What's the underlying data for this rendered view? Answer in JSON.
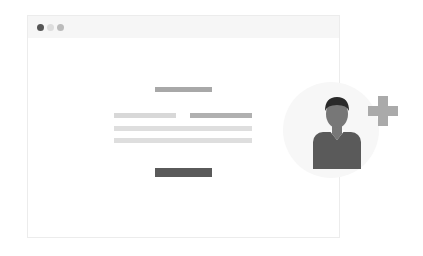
{
  "illustration": {
    "description": "Add user illustration",
    "colors": {
      "window_border": "#ececec",
      "titlebar": "#f6f6f6",
      "dot_dark": "#555555",
      "dot_light": "#dddddd",
      "dot_mid": "#bbbbbb",
      "heading_bar": "#a8a8a8",
      "label_bar_light": "#d8d8d8",
      "label_bar_dark": "#b0b0b0",
      "text_line": "#dedede",
      "button_bar": "#5a5a5a",
      "circle_bg": "#f7f7f7",
      "person_head": "#777777",
      "person_hair": "#2a2a2a",
      "person_body": "#5a5a5a",
      "person_collar": "#ffffff",
      "plus": "#aaaaaa"
    },
    "window_controls": [
      "close",
      "minimize",
      "maximize"
    ],
    "icons": [
      "user-icon",
      "plus-icon"
    ]
  }
}
